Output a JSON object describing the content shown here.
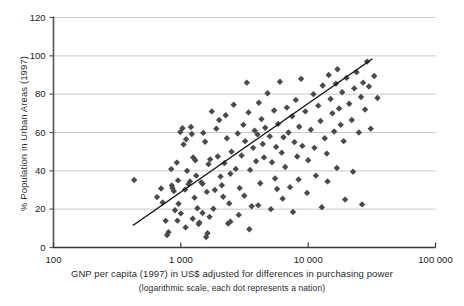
{
  "chart_data": {
    "type": "scatter",
    "title": "",
    "xlabel": "GNP per capita (1997) in US$ adjusted for differences in purchasing power",
    "xlabel_sub": "(logarithmic scale, each dot represents a nation)",
    "ylabel": "% Population in Urban Areas (1997)",
    "xscale": "log",
    "xlim": [
      100,
      100000
    ],
    "ylim": [
      0,
      120
    ],
    "xticks": [
      100,
      1000,
      10000,
      100000
    ],
    "xtick_labels": [
      "100",
      "1 000",
      "10 000",
      "100 000"
    ],
    "yticks": [
      0,
      20,
      40,
      60,
      80,
      100,
      120
    ],
    "ytick_labels": [
      "0",
      "20",
      "40",
      "60",
      "80",
      "100",
      "120"
    ],
    "grid": "horizontal",
    "legend": "none",
    "marker": "diamond",
    "marker_color": "#4a4a4a",
    "marker_size": 3.2,
    "grid_color": "#c8c8c8",
    "axis_color": "#555555",
    "trendline": {
      "label": "linear fit (log x)",
      "color": "#111111",
      "x": [
        420,
        32000
      ],
      "y": [
        11.5,
        98.5
      ]
    },
    "points": [
      [
        430,
        35.2
      ],
      [
        650,
        26.3
      ],
      [
        700,
        30.8
      ],
      [
        720,
        23.5
      ],
      [
        760,
        13.9
      ],
      [
        780,
        6.5
      ],
      [
        800,
        8.0
      ],
      [
        840,
        40.9
      ],
      [
        850,
        32.4
      ],
      [
        860,
        31.0
      ],
      [
        880,
        29.5
      ],
      [
        900,
        19.4
      ],
      [
        930,
        44.3
      ],
      [
        950,
        35.0
      ],
      [
        960,
        22.8
      ],
      [
        990,
        60.2
      ],
      [
        1000,
        17.8
      ],
      [
        1030,
        62.2
      ],
      [
        1050,
        53.8
      ],
      [
        1080,
        30.2
      ],
      [
        1100,
        56.5
      ],
      [
        1120,
        40.0
      ],
      [
        1150,
        33.0
      ],
      [
        1180,
        34.5
      ],
      [
        1200,
        62.9
      ],
      [
        1220,
        59.2
      ],
      [
        1250,
        47.0
      ],
      [
        1280,
        26.0
      ],
      [
        1300,
        45.5
      ],
      [
        1320,
        37.5
      ],
      [
        1350,
        20.5
      ],
      [
        1380,
        12.2
      ],
      [
        1400,
        13.0
      ],
      [
        1450,
        34.0
      ],
      [
        1480,
        33.2
      ],
      [
        1500,
        59.8
      ],
      [
        1550,
        55.2
      ],
      [
        1600,
        29.0
      ],
      [
        1650,
        43.5
      ],
      [
        1700,
        46.0
      ],
      [
        1750,
        71.0
      ],
      [
        1800,
        20.2
      ],
      [
        1850,
        30.0
      ],
      [
        1900,
        62.0
      ],
      [
        1950,
        47.5
      ],
      [
        2000,
        66.5
      ],
      [
        2050,
        37.0
      ],
      [
        2100,
        32.5
      ],
      [
        2200,
        44.0
      ],
      [
        2250,
        69.0
      ],
      [
        2300,
        57.0
      ],
      [
        2400,
        23.0
      ],
      [
        2450,
        38.5
      ],
      [
        2500,
        50.0
      ],
      [
        2600,
        74.5
      ],
      [
        2700,
        41.0
      ],
      [
        2800,
        59.5
      ],
      [
        2900,
        31.0
      ],
      [
        3000,
        48.0
      ],
      [
        3100,
        64.0
      ],
      [
        3200,
        55.5
      ],
      [
        3300,
        86.0
      ],
      [
        3400,
        70.5
      ],
      [
        3500,
        40.5
      ],
      [
        3600,
        21.5
      ],
      [
        3700,
        52.0
      ],
      [
        3800,
        61.0
      ],
      [
        3900,
        45.0
      ],
      [
        4000,
        59.0
      ],
      [
        4100,
        75.5
      ],
      [
        4200,
        33.5
      ],
      [
        4300,
        67.0
      ],
      [
        4400,
        54.0
      ],
      [
        4500,
        47.0
      ],
      [
        4600,
        62.5
      ],
      [
        4800,
        80.5
      ],
      [
        5000,
        58.0
      ],
      [
        5200,
        44.5
      ],
      [
        5400,
        71.5
      ],
      [
        5500,
        36.0
      ],
      [
        5600,
        52.5
      ],
      [
        5800,
        64.5
      ],
      [
        6000,
        86.5
      ],
      [
        6200,
        49.5
      ],
      [
        6400,
        57.5
      ],
      [
        6600,
        42.0
      ],
      [
        6800,
        73.0
      ],
      [
        7000,
        60.0
      ],
      [
        7200,
        31.5
      ],
      [
        7500,
        68.5
      ],
      [
        7800,
        55.0
      ],
      [
        8000,
        77.0
      ],
      [
        8200,
        47.5
      ],
      [
        8500,
        63.0
      ],
      [
        8800,
        88.0
      ],
      [
        9000,
        53.0
      ],
      [
        9500,
        71.0
      ],
      [
        10000,
        45.5
      ],
      [
        10500,
        61.5
      ],
      [
        11000,
        80.0
      ],
      [
        11500,
        37.5
      ],
      [
        12000,
        74.0
      ],
      [
        12500,
        66.0
      ],
      [
        13000,
        84.5
      ],
      [
        13500,
        57.0
      ],
      [
        14000,
        49.0
      ],
      [
        14500,
        90.0
      ],
      [
        15000,
        77.5
      ],
      [
        15500,
        70.0
      ],
      [
        16000,
        60.5
      ],
      [
        16500,
        85.5
      ],
      [
        17000,
        93.0
      ],
      [
        17500,
        72.5
      ],
      [
        18000,
        64.0
      ],
      [
        18500,
        81.0
      ],
      [
        19000,
        55.5
      ],
      [
        20000,
        88.5
      ],
      [
        21000,
        75.0
      ],
      [
        22000,
        66.5
      ],
      [
        23000,
        83.0
      ],
      [
        24000,
        91.5
      ],
      [
        25000,
        60.0
      ],
      [
        26000,
        78.5
      ],
      [
        27000,
        86.0
      ],
      [
        28000,
        72.0
      ],
      [
        29000,
        97.0
      ],
      [
        30000,
        84.0
      ],
      [
        31000,
        62.0
      ],
      [
        26500,
        22.5
      ],
      [
        22500,
        39.5
      ],
      [
        19500,
        25.0
      ],
      [
        16800,
        41.5
      ],
      [
        12800,
        21.0
      ],
      [
        9800,
        28.5
      ],
      [
        7600,
        18.5
      ],
      [
        6300,
        25.5
      ],
      [
        5100,
        20.0
      ],
      [
        4050,
        22.0
      ],
      [
        3450,
        9.5
      ],
      [
        2850,
        17.0
      ],
      [
        2150,
        26.5
      ],
      [
        1680,
        16.0
      ],
      [
        1480,
        18.0
      ],
      [
        1240,
        15.0
      ],
      [
        1090,
        10.5
      ],
      [
        940,
        14.0
      ],
      [
        1580,
        5.5
      ],
      [
        1620,
        7.5
      ],
      [
        35000,
        78.0
      ],
      [
        33000,
        89.5
      ],
      [
        14200,
        34.5
      ],
      [
        11200,
        52.0
      ],
      [
        8400,
        35.5
      ],
      [
        5700,
        30.5
      ],
      [
        3150,
        27.0
      ],
      [
        2350,
        12.5
      ],
      [
        2450,
        13.5
      ]
    ]
  }
}
